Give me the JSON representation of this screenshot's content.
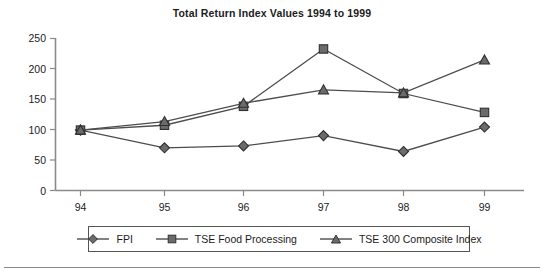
{
  "chart_data": {
    "type": "line",
    "title": "Total Return Index Values 1994 to 1999",
    "xlabel": "",
    "ylabel": "",
    "categories": [
      "94",
      "95",
      "96",
      "97",
      "98",
      "99"
    ],
    "ylim": [
      0,
      250
    ],
    "yticks": [
      0,
      50,
      100,
      150,
      200,
      250
    ],
    "ytick_labels": [
      "0",
      "50",
      "100",
      "150",
      "200",
      "250"
    ],
    "grid": false,
    "legend_position": "bottom",
    "series": [
      {
        "name": "FPI",
        "marker": "diamond",
        "color": "#4d4d4d",
        "values": [
          99,
          70,
          73,
          90,
          64,
          104
        ]
      },
      {
        "name": "TSE Food Processing",
        "marker": "square",
        "color": "#4d4d4d",
        "values": [
          99,
          107,
          138,
          232,
          159,
          128
        ]
      },
      {
        "name": "TSE 300 Composite Index",
        "marker": "triangle",
        "color": "#4d4d4d",
        "values": [
          99,
          113,
          143,
          165,
          160,
          214
        ]
      }
    ]
  },
  "legend": {
    "items": [
      {
        "label": "FPI",
        "marker": "diamond-marker"
      },
      {
        "label": "TSE Food Processing",
        "marker": "square-marker"
      },
      {
        "label": "TSE 300 Composite Index",
        "marker": "triangle-marker"
      }
    ]
  },
  "colors": {
    "axis": "#8a8a8a",
    "series": "#4d4d4d",
    "text": "#1c1c1c",
    "legend_border": "#555555",
    "rule": "#8a8a8a"
  },
  "axis": {
    "y_tick_0": "0",
    "y_tick_1": "50",
    "y_tick_2": "100",
    "y_tick_3": "150",
    "y_tick_4": "200",
    "y_tick_5": "250",
    "x_tick_0": "94",
    "x_tick_1": "95",
    "x_tick_2": "96",
    "x_tick_3": "97",
    "x_tick_4": "98",
    "x_tick_5": "99"
  }
}
